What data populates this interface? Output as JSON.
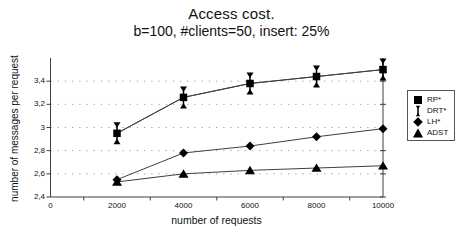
{
  "chart_data": {
    "type": "line",
    "title": "Access cost.",
    "subtitle": "b=100, #clients=50, insert: 25%",
    "xlabel": "number of requests",
    "ylabel": "number of messages per request",
    "x": [
      2000,
      4000,
      6000,
      8000,
      10000
    ],
    "series": [
      {
        "name": "RP*",
        "marker": "square",
        "values": [
          2.95,
          3.26,
          3.38,
          3.44,
          3.5
        ]
      },
      {
        "name": "DRT*",
        "marker": "ibeam",
        "values": [
          2.95,
          3.26,
          3.38,
          3.44,
          3.5
        ]
      },
      {
        "name": "LH*",
        "marker": "diamond",
        "values": [
          2.55,
          2.78,
          2.84,
          2.92,
          2.99
        ]
      },
      {
        "name": "ADST",
        "marker": "triangle",
        "values": [
          2.53,
          2.6,
          2.63,
          2.65,
          2.67
        ]
      }
    ],
    "xlim": [
      0,
      10000
    ],
    "ylim": [
      2.4,
      3.6
    ],
    "xticks": {
      "values": [
        0,
        2000,
        4000,
        6000,
        8000,
        10000
      ],
      "labels": [
        "0",
        "2000",
        "4000",
        "6000",
        "8000",
        "10000"
      ],
      "minor": [
        1000,
        3000,
        5000,
        7000,
        9000
      ]
    },
    "yticks": {
      "values": [
        2.4,
        2.6,
        2.8,
        3.0,
        3.2,
        3.4
      ],
      "labels": [
        "2,4",
        "2,6",
        "2,8",
        "3",
        "3,2",
        "3,4"
      ]
    },
    "grid": {
      "horizontal": true,
      "style": "dotted"
    },
    "legend": {
      "position": "right-outside",
      "entries": [
        "RP*",
        "DRT*",
        "LH*",
        "ADST"
      ]
    },
    "colors": {
      "marker": "#000000",
      "line": "#3f3f3f",
      "grid": "#9a9a9a",
      "axis": "#3f3f3f",
      "text": "#111111"
    }
  }
}
